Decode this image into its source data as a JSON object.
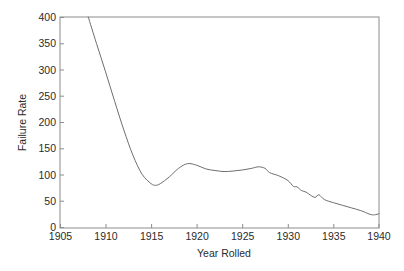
{
  "chart_data": {
    "type": "line",
    "title": "",
    "xlabel": "Year Rolled",
    "ylabel": "Failure Rate",
    "xlim": [
      1905,
      1940
    ],
    "ylim": [
      0,
      400
    ],
    "xticks": [
      1905,
      1910,
      1915,
      1920,
      1925,
      1930,
      1935,
      1940
    ],
    "yticks": [
      0,
      50,
      100,
      150,
      200,
      250,
      300,
      350,
      400
    ],
    "grid": false,
    "legend": null,
    "series": [
      {
        "name": "Failure Rate",
        "x": [
          1908.1,
          1909.0,
          1910.0,
          1911.0,
          1912.0,
          1913.0,
          1914.0,
          1915.0,
          1915.5,
          1916.0,
          1917.0,
          1918.0,
          1919.0,
          1920.0,
          1921.0,
          1922.0,
          1923.0,
          1924.0,
          1925.0,
          1926.0,
          1926.8,
          1927.5,
          1928.0,
          1929.0,
          1930.0,
          1930.6,
          1931.0,
          1931.5,
          1932.0,
          1932.5,
          1933.0,
          1933.4,
          1934.0,
          1935.0,
          1936.0,
          1937.0,
          1938.0,
          1939.0,
          1939.5,
          1940.0
        ],
        "y": [
          400,
          350,
          296,
          240,
          186,
          138,
          102,
          84,
          81,
          84,
          97,
          113,
          122,
          119,
          112,
          109,
          107,
          108,
          110,
          113,
          116,
          113,
          105,
          99,
          90,
          79,
          78,
          71,
          68,
          62,
          58,
          63,
          54,
          48,
          43,
          38,
          33,
          26,
          25,
          27
        ]
      }
    ]
  },
  "axes": {
    "x_tick_labels": [
      "1905",
      "1910",
      "1915",
      "1920",
      "1925",
      "1930",
      "1935",
      "1940"
    ],
    "y_tick_labels": [
      "0",
      "50",
      "100",
      "150",
      "200",
      "250",
      "300",
      "350",
      "400"
    ],
    "x_axis_title": "Year Rolled",
    "y_axis_title": "Failure Rate"
  },
  "colors": {
    "curve": "#6e6e6e",
    "frame": "#8c8c8c",
    "text": "#2b2b2b",
    "background": "#ffffff"
  }
}
